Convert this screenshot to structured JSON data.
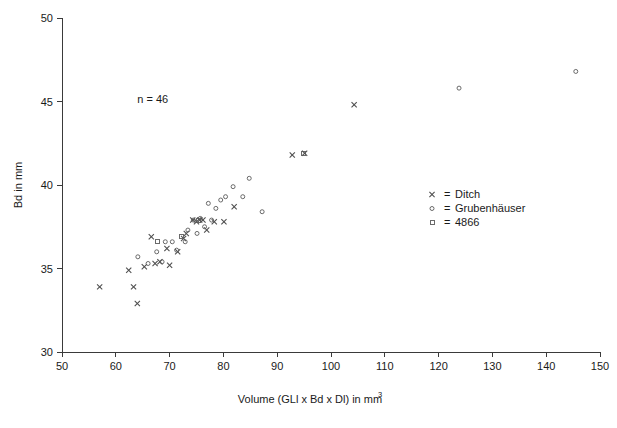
{
  "chart_data": {
    "type": "scatter",
    "title": "",
    "xlabel": "Volume (GLl x Bd x Dl) in mm",
    "xlabel_sup": "3",
    "ylabel": "Bd in mm",
    "xlim": [
      50,
      150
    ],
    "ylim": [
      30,
      50
    ],
    "xticks": [
      50,
      60,
      70,
      80,
      90,
      100,
      110,
      120,
      130,
      140,
      150
    ],
    "yticks": [
      30,
      35,
      40,
      45,
      50
    ],
    "grid": false,
    "annotation": "n = 46",
    "annotation_x": 64,
    "annotation_y": 44.9,
    "legend_position": "right",
    "legend": [
      {
        "marker": "x-marker",
        "equals": "=",
        "label": "Ditch"
      },
      {
        "marker": "circle-marker",
        "equals": "=",
        "label": "Grubenhäuser"
      },
      {
        "marker": "square-marker",
        "equals": "=",
        "label": "4866"
      }
    ],
    "series": [
      {
        "name": "Ditch",
        "marker": "x",
        "points": [
          [
            57.0,
            33.9
          ],
          [
            62.4,
            34.9
          ],
          [
            63.3,
            33.9
          ],
          [
            64.0,
            32.9
          ],
          [
            65.3,
            35.1
          ],
          [
            66.6,
            36.9
          ],
          [
            67.3,
            35.3
          ],
          [
            68.2,
            35.4
          ],
          [
            69.5,
            36.2
          ],
          [
            70.0,
            35.2
          ],
          [
            71.5,
            36.0
          ],
          [
            72.6,
            36.8
          ],
          [
            73.1,
            37.1
          ],
          [
            74.3,
            37.9
          ],
          [
            75.0,
            37.8
          ],
          [
            75.6,
            37.9
          ],
          [
            76.2,
            37.9
          ],
          [
            76.9,
            37.3
          ],
          [
            78.3,
            37.8
          ],
          [
            80.1,
            37.8
          ],
          [
            82.0,
            38.7
          ],
          [
            92.8,
            41.8
          ],
          [
            95.1,
            41.9
          ],
          [
            104.3,
            44.8
          ]
        ]
      },
      {
        "name": "Grubenhäuser",
        "marker": "o",
        "points": [
          [
            64.1,
            35.7
          ],
          [
            66.0,
            35.3
          ],
          [
            67.6,
            36.0
          ],
          [
            68.6,
            35.4
          ],
          [
            69.2,
            36.6
          ],
          [
            70.5,
            36.6
          ],
          [
            71.3,
            36.1
          ],
          [
            72.9,
            36.6
          ],
          [
            73.4,
            37.3
          ],
          [
            74.4,
            37.9
          ],
          [
            75.1,
            37.1
          ],
          [
            75.7,
            38.0
          ],
          [
            76.5,
            37.5
          ],
          [
            77.2,
            38.9
          ],
          [
            77.8,
            37.9
          ],
          [
            78.6,
            38.6
          ],
          [
            79.5,
            39.1
          ],
          [
            80.4,
            39.3
          ],
          [
            81.8,
            39.9
          ],
          [
            83.6,
            39.3
          ],
          [
            84.8,
            40.4
          ],
          [
            87.2,
            38.4
          ],
          [
            123.8,
            45.8
          ],
          [
            145.5,
            46.8
          ]
        ]
      },
      {
        "name": "4866",
        "marker": "s",
        "points": [
          [
            67.8,
            36.6
          ],
          [
            72.2,
            36.9
          ],
          [
            75.4,
            37.9
          ],
          [
            94.9,
            41.9
          ]
        ]
      }
    ]
  }
}
